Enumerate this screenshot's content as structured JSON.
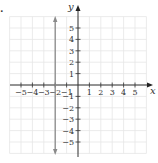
{
  "chart_data": {
    "type": "line",
    "title": "",
    "xlabel": "x",
    "ylabel": "y",
    "xlim": [
      -6,
      6
    ],
    "ylim": [
      -6,
      6
    ],
    "grid": true,
    "x_ticks": [
      -5,
      -4,
      -3,
      -2,
      -1,
      1,
      2,
      3,
      4,
      5
    ],
    "y_ticks": [
      5,
      4,
      3,
      2,
      1,
      -1,
      -2,
      -3,
      -4,
      -5
    ],
    "x_tick_labels": [
      "−5",
      "−4",
      "−3",
      "−2",
      "−1",
      "1",
      "2",
      "3",
      "4",
      "5"
    ],
    "y_tick_labels": [
      "5",
      "4",
      "3",
      "2",
      "1",
      "−1",
      "−2",
      "−3",
      "−4",
      "−5"
    ],
    "series": [
      {
        "name": "x = -2",
        "kind": "vertical-line",
        "x": -2,
        "arrows": "both",
        "color": "#8a8a8a"
      }
    ]
  },
  "marker": "."
}
